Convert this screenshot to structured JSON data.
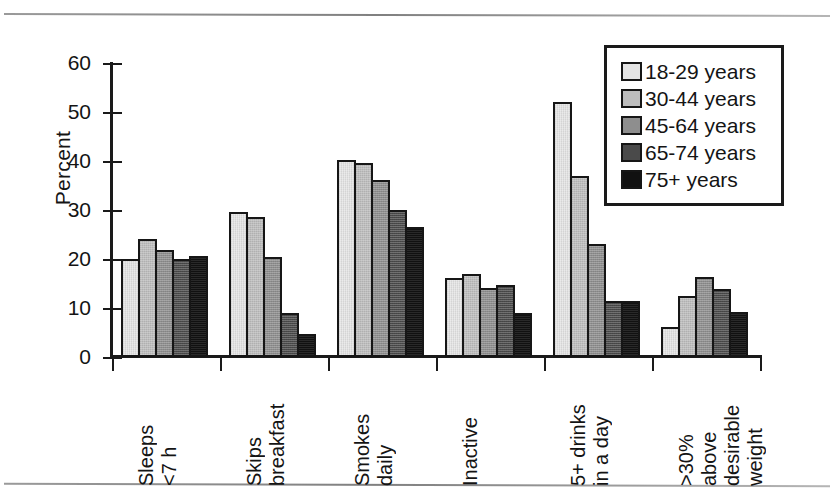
{
  "chart_data": {
    "type": "bar",
    "title": "",
    "xlabel": "",
    "ylabel": "Percent",
    "ylim": [
      0,
      60
    ],
    "yticks": [
      0,
      10,
      20,
      30,
      40,
      50,
      60
    ],
    "grid": false,
    "legend_position": "top-right",
    "categories": [
      "Sleeps <7 h",
      "Skips breakfast",
      "Smokes daily",
      "Inactive",
      "5+ drinks in a day",
      ">30% above desirable weight"
    ],
    "category_lines": [
      [
        "Sleeps",
        "<7 h"
      ],
      [
        "Skips",
        "breakfast"
      ],
      [
        "Smokes",
        "daily"
      ],
      [
        "Inactive"
      ],
      [
        "5+ drinks",
        "in a day"
      ],
      [
        ">30%",
        "above",
        "desirable",
        "weight"
      ]
    ],
    "series": [
      {
        "name": "18-29 years",
        "color": "#e4e4e4",
        "values": [
          20.0,
          29.5,
          40.3,
          16.2,
          52.0,
          6.1
        ]
      },
      {
        "name": "30-44 years",
        "color": "#bdbdbd",
        "values": [
          24.0,
          28.6,
          39.6,
          17.0,
          37.0,
          12.5
        ]
      },
      {
        "name": "45-64 years",
        "color": "#8e8e8e",
        "values": [
          21.9,
          20.5,
          36.2,
          14.0,
          23.1,
          16.4
        ]
      },
      {
        "name": "65-74 years",
        "color": "#4a4a4a",
        "values": [
          20.0,
          8.9,
          30.1,
          14.6,
          11.5,
          13.9
        ]
      },
      {
        "name": "75+ years",
        "color": "#111111",
        "values": [
          20.7,
          4.7,
          26.5,
          9.0,
          11.5,
          9.1
        ]
      }
    ]
  },
  "legend": {
    "items": [
      {
        "label": "18-29 years"
      },
      {
        "label": "30-44 years"
      },
      {
        "label": "45-64 years"
      },
      {
        "label": "65-74 years"
      },
      {
        "label": "75+ years"
      }
    ]
  }
}
